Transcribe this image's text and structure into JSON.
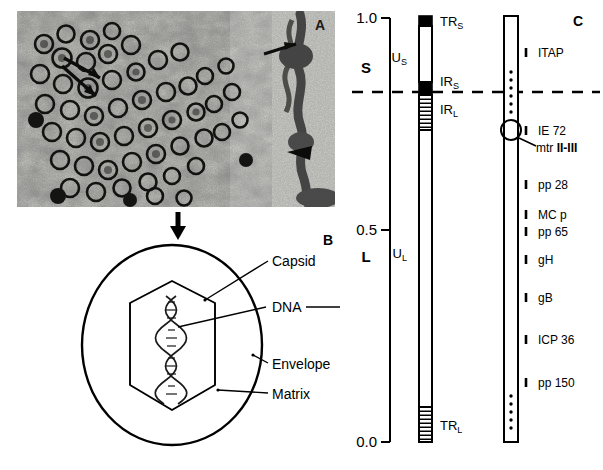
{
  "figure": {
    "panels": {
      "a": {
        "letter": "A",
        "caption_text": ""
      },
      "b": {
        "letter": "B"
      },
      "c": {
        "letter": "C"
      }
    },
    "axis": {
      "ticks": [
        {
          "value": "1.0",
          "pos": 1.0
        },
        {
          "value": "0.5",
          "pos": 0.5
        },
        {
          "value": "0.0",
          "pos": 0.0
        }
      ],
      "region_labels": [
        {
          "label": "S",
          "pos": 0.84
        },
        {
          "label": "L",
          "pos": 0.45
        }
      ]
    },
    "genome_map": {
      "segments": [
        {
          "name": "TR_S",
          "label": "TR",
          "sub": "S",
          "fill": "solid"
        },
        {
          "name": "U_S",
          "label": "U",
          "sub": "S",
          "fill": "open"
        },
        {
          "name": "IR_S",
          "label": "IR",
          "sub": "S",
          "fill": "solid"
        },
        {
          "name": "IR_L",
          "label": "IR",
          "sub": "L",
          "fill": "hatched"
        },
        {
          "name": "U_L",
          "label": "U",
          "sub": "L",
          "fill": "open"
        },
        {
          "name": "TR_L",
          "label": "TR",
          "sub": "L",
          "fill": "hatched"
        }
      ]
    },
    "gene_map": {
      "markers": [
        {
          "label": "ITAP",
          "bold_suffix": "",
          "y": 53
        },
        {
          "label": "IE 72",
          "bold_suffix": "",
          "y": 130
        },
        {
          "label": "pp 28",
          "bold_suffix": "",
          "y": 184
        },
        {
          "label": "MC p",
          "bold_suffix": "",
          "y": 214
        },
        {
          "label": "pp 65",
          "bold_suffix": "",
          "y": 231
        },
        {
          "label": "gH",
          "bold_suffix": "",
          "y": 259
        },
        {
          "label": "gB",
          "bold_suffix": "",
          "y": 297
        },
        {
          "label": "ICP 36",
          "bold_suffix": "",
          "y": 339
        },
        {
          "label": "pp 150",
          "bold_suffix": "",
          "y": 382
        }
      ],
      "annotation": {
        "prefix": "mtr ",
        "bold": "II-III",
        "y": 147
      }
    },
    "virion_diagram": {
      "labels": [
        {
          "text": "Capsid",
          "y": 264
        },
        {
          "text": "DNA",
          "y": 310
        },
        {
          "text": "Envelope",
          "y": 366
        },
        {
          "text": "Matrix",
          "y": 396
        }
      ]
    }
  },
  "colors": {
    "ink": "#000000",
    "micrograph_dark": "#2b2b2b",
    "micrograph_light": "#e8e8e4",
    "background": "#ffffff"
  }
}
